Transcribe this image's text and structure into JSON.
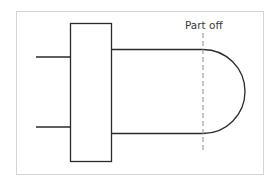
{
  "diagram": {
    "type": "machining-schematic",
    "labels": {
      "part_off": "Part off"
    },
    "colors": {
      "line": "#2a2a2a",
      "border": "#cfcfcf",
      "dashed": "#8a8a8a",
      "background": "#ffffff"
    },
    "elements": [
      {
        "name": "chuck-jaw-block",
        "kind": "rectangle"
      },
      {
        "name": "upper-chuck-prong",
        "kind": "line"
      },
      {
        "name": "lower-chuck-prong",
        "kind": "line"
      },
      {
        "name": "workpiece-stock",
        "kind": "rounded-bar"
      },
      {
        "name": "part-off-line",
        "kind": "dashed-line"
      }
    ]
  }
}
